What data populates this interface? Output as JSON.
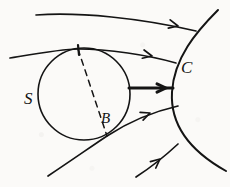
{
  "figure": {
    "background_color": "#fbfaf8",
    "ink_color": "#141414",
    "labels": [
      {
        "id": "S",
        "text": "S",
        "meaning": "sphere-label",
        "x": 30,
        "y": 100
      },
      {
        "id": "B",
        "text": "B",
        "meaning": "point-b-label",
        "x": 107,
        "y": 121
      },
      {
        "id": "C",
        "text": "C",
        "meaning": "curve-c-label",
        "x": 187,
        "y": 69
      }
    ],
    "shapes": {
      "circle": {
        "name": "sphere-S",
        "center_x": 84,
        "center_y": 94,
        "radius": 46,
        "stroke_width": 1.6
      },
      "dashed_chord": {
        "name": "dashed-chord-top-to-B",
        "from_x": 78,
        "from_y": 49,
        "to_x": 107,
        "to_y": 136,
        "dash_pattern": "6 5",
        "stroke_width": 1.5
      },
      "tick_mark": {
        "name": "tangency-tick-mark",
        "x1": 78,
        "y1": 45,
        "x2": 79,
        "y2": 55,
        "stroke_width": 2.2
      },
      "big_curve_C": {
        "name": "curve-C-arc",
        "path": "M 218 10 C 196 32, 174 58, 172 92 C 170 126, 192 152, 226 171",
        "stroke_width": 2.0
      }
    },
    "streamlines": [
      {
        "name": "streamline-top",
        "path": "M 36 15 C 80 12, 140 18, 196 31",
        "stroke_width": 1.7,
        "arrow_at_x": 178,
        "arrow_at_y": 26,
        "arrow_angle_deg": 13
      },
      {
        "name": "streamline-upper-tangent",
        "path": "M 10 58 C 40 53, 62 49, 78 49 C 108 49, 148 55, 176 63",
        "stroke_width": 1.7,
        "arrow_at_x": 152,
        "arrow_at_y": 56,
        "arrow_angle_deg": 12
      },
      {
        "name": "streamline-middle-bold",
        "path": "M 129 88 L 173 88",
        "stroke_width": 3.0,
        "arrow_at_x": 166,
        "arrow_at_y": 88,
        "arrow_angle_deg": 0
      },
      {
        "name": "streamline-through-B",
        "path": "M 48 176 C 72 160, 92 146, 107 136 C 130 121, 156 111, 178 106",
        "stroke_width": 1.7,
        "arrow_at_x": 150,
        "arrow_at_y": 113,
        "arrow_angle_deg": -21
      },
      {
        "name": "streamline-bottom",
        "path": "M 136 177 C 150 168, 164 157, 178 144",
        "stroke_width": 1.7,
        "arrow_at_x": 160,
        "arrow_at_y": 159,
        "arrow_angle_deg": -40
      }
    ]
  }
}
